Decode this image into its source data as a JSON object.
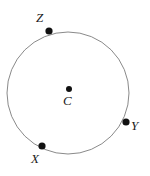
{
  "figure": {
    "width": 150,
    "height": 176,
    "background_color": "#ffffff",
    "stroke_color": "#8a8a8a",
    "point_color": "#111111",
    "label_color": "#1a1a1a",
    "circle": {
      "center_x": 68,
      "center_y": 93,
      "radius": 61,
      "stroke_width": 1
    },
    "center_point": {
      "label": "C",
      "x": 69,
      "y": 89,
      "dot_radius": 3
    },
    "points": [
      {
        "label": "Z",
        "x": 49,
        "y": 31,
        "dot_radius": 3.6
      },
      {
        "label": "Y",
        "x": 126,
        "y": 122,
        "dot_radius": 3.6
      },
      {
        "label": "X",
        "x": 42,
        "y": 146,
        "dot_radius": 3.6
      }
    ]
  }
}
